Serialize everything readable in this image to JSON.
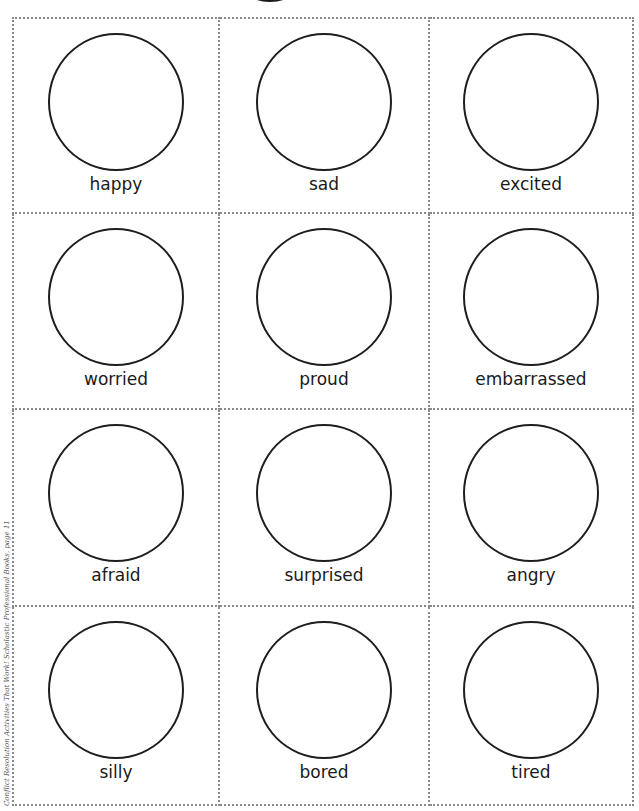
{
  "worksheet": {
    "cards": [
      {
        "label": "happy"
      },
      {
        "label": "sad"
      },
      {
        "label": "excited"
      },
      {
        "label": "worried"
      },
      {
        "label": "proud"
      },
      {
        "label": "embarrassed"
      },
      {
        "label": "afraid"
      },
      {
        "label": "surprised"
      },
      {
        "label": "angry"
      },
      {
        "label": "silly"
      },
      {
        "label": "bored"
      },
      {
        "label": "tired"
      }
    ]
  },
  "footer": {
    "credit": "Conflict Resolution Activities That Work! Scholastic Professional Books, page 11"
  }
}
